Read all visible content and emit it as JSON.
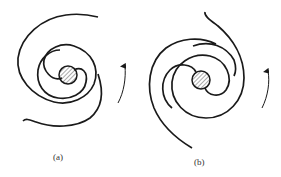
{
  "figure": {
    "panels": [
      {
        "id": "a",
        "label": "(a)",
        "description": "spiral with trailing arms, clockwise-wound",
        "rotation_arrow": "counterclockwise (upward on right side)"
      },
      {
        "id": "b",
        "label": "(b)",
        "description": "spiral with arms wound opposite sense",
        "rotation_arrow": "counterclockwise (upward on right side)"
      }
    ],
    "colors": {
      "ink": "#1a1a1a",
      "hatch": "#555555",
      "background": "#ffffff"
    }
  }
}
